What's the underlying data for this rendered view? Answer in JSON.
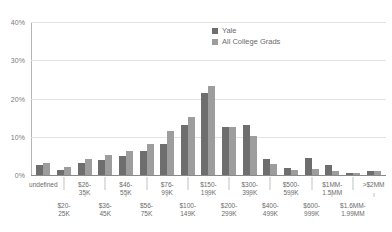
{
  "chart_data": {
    "type": "bar",
    "title": "",
    "subtitle": "",
    "xlabel": "",
    "ylabel": "",
    "ylim": [
      0,
      40
    ],
    "yticks": [
      0,
      10,
      20,
      30,
      40
    ],
    "ytick_labels": [
      "0%",
      "10%",
      "20%",
      "30%",
      "40%"
    ],
    "grid": true,
    "legend_position": "top-right",
    "categories": [
      "<$20K",
      "$20-25K",
      "$26-35K",
      "$36-45K",
      "$46-55K",
      "$56-75K",
      "$76-99K",
      "$100-149K",
      "$150-199K",
      "$200-299K",
      "$300-399K",
      "$400-499K",
      "$500-599K",
      "$600-999K",
      "$1MM-1.5MM",
      "$1.6MM-1.99MM",
      ">$2MM"
    ],
    "series": [
      {
        "name": "Yale",
        "color": "#6e6e6e",
        "values": [
          2.6,
          1.2,
          3.1,
          4.0,
          5.1,
          6.2,
          8.1,
          13.2,
          21.4,
          12.5,
          13.2,
          4.3,
          1.9,
          4.4,
          2.6,
          0.5,
          1.1
        ]
      },
      {
        "name": "All College Grads",
        "color": "#9d9d9d",
        "values": [
          3.2,
          2.2,
          4.1,
          5.2,
          6.2,
          8.1,
          11.6,
          15.2,
          23.4,
          12.6,
          10.2,
          3.0,
          1.3,
          1.5,
          1.0,
          0.4,
          1.0
        ]
      }
    ]
  },
  "legend": {
    "items": [
      {
        "label": "Yale"
      },
      {
        "label": "All College Grads"
      }
    ]
  },
  "x_axis": {
    "ticks": [
      {
        "label": "<$20K",
        "row": "top"
      },
      {
        "label": "$20-\n25K",
        "row": "bottom",
        "line1": "$20-",
        "line2": "25K"
      },
      {
        "label": "$26-\n35K",
        "row": "top",
        "line1": "$26-",
        "line2": "35K"
      },
      {
        "label": "$36-\n45K",
        "row": "bottom",
        "line1": "$36-",
        "line2": "45K"
      },
      {
        "label": "$46-\n55K",
        "row": "top",
        "line1": "$46-",
        "line2": "55K"
      },
      {
        "label": "$56-\n75K",
        "row": "bottom",
        "line1": "$56-",
        "line2": "75K"
      },
      {
        "label": "$76-\n99K",
        "row": "top",
        "line1": "$76-",
        "line2": "99K"
      },
      {
        "label": "$100-\n149K",
        "row": "bottom",
        "line1": "$100-",
        "line2": "149K"
      },
      {
        "label": "$150-\n199K",
        "row": "top",
        "line1": "$150-",
        "line2": "199K"
      },
      {
        "label": "$200-\n299K",
        "row": "bottom",
        "line1": "$200-",
        "line2": "299K"
      },
      {
        "label": "$300-\n399K",
        "row": "top",
        "line1": "$300-",
        "line2": "399K"
      },
      {
        "label": "$400-\n499K",
        "row": "bottom",
        "line1": "$400-",
        "line2": "499K"
      },
      {
        "label": "$500-\n599K",
        "row": "top",
        "line1": "$500-",
        "line2": "599K"
      },
      {
        "label": "$600-\n999K",
        "row": "bottom",
        "line1": "$600-",
        "line2": "999K"
      },
      {
        "label": "$1MM-\n1.5MM",
        "row": "top",
        "line1": "$1MM-",
        "line2": "1.5MM"
      },
      {
        "label": "$1.6MM-\n1.99MM",
        "row": "bottom",
        "line1": "$1.6MM-",
        "line2": "1.99MM"
      },
      {
        "label": ">$2MM",
        "row": "top",
        "line1": ">$2MM",
        "line2": ""
      }
    ]
  },
  "colors": {
    "series_a": "#6e6e6e",
    "series_b": "#9d9d9d",
    "gridline": "#e3e3e3",
    "axis": "#8a8a8a",
    "text": "#6b6b6b",
    "background": "#ffffff"
  }
}
